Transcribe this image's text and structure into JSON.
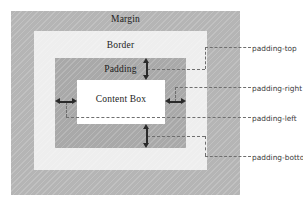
{
  "diagram": {
    "canvas": {
      "width": 303,
      "height": 207,
      "background": "#ffffff"
    },
    "boxes": [
      {
        "name": "margin",
        "label": "Margin",
        "color": "#b5b5b5"
      },
      {
        "name": "border",
        "label": "Border",
        "color": "#eeeeee"
      },
      {
        "name": "padding",
        "label": "Padding",
        "color": "#a9a9a9"
      },
      {
        "name": "content",
        "label": "Content Box",
        "color": "#ffffff"
      }
    ],
    "annotations": [
      {
        "name": "padding-top",
        "label": "padding-top"
      },
      {
        "name": "padding-right",
        "label": "padding-right"
      },
      {
        "name": "padding-left",
        "label": "padding-left"
      },
      {
        "name": "padding-bottom",
        "label": "padding-botton"
      }
    ],
    "arrow_color": "#2a2a2a",
    "leader_color": "#6f6f6f",
    "text_color": "#1c1c1c"
  }
}
